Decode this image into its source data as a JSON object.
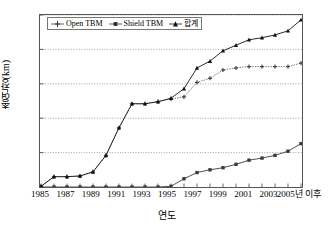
{
  "chart_data": {
    "type": "line",
    "title": "",
    "xlabel": "연도",
    "ylabel": "총연장(km)",
    "ylim": [
      0,
      250
    ],
    "yticks": [
      0,
      50,
      100,
      150,
      200,
      250
    ],
    "grid": true,
    "legend_position": "top-left-inside",
    "x": [
      "1985",
      "1986",
      "1987",
      "1988",
      "1989",
      "1990",
      "1991",
      "1992",
      "1993",
      "1994",
      "1995",
      "1996",
      "1997",
      "1998",
      "1999",
      "2000",
      "2001",
      "2002",
      "2003",
      "2004",
      "2005년 이후"
    ],
    "xtick_labels": [
      "1985",
      "",
      "1987",
      "",
      "1989",
      "",
      "1991",
      "",
      "1993",
      "",
      "1995",
      "",
      "1997",
      "",
      "1999",
      "",
      "2001",
      "",
      "2003",
      "",
      "2005년 이후"
    ],
    "series": [
      {
        "name": "Open TBM",
        "marker": "plus",
        "color": "#3a3a3a",
        "values": [
          1,
          15,
          15,
          16,
          22,
          46,
          86,
          121,
          121,
          124,
          128,
          131,
          152,
          158,
          170,
          173,
          175,
          175,
          175,
          175,
          180
        ]
      },
      {
        "name": "Shield TBM",
        "marker": "square",
        "color": "#3a3a3a",
        "values": [
          0,
          0,
          0,
          0,
          0,
          0,
          0,
          0,
          0,
          0,
          1,
          12,
          21,
          25,
          28,
          33,
          39,
          42,
          46,
          52,
          63
        ]
      },
      {
        "name": "합계",
        "marker": "triangle",
        "color": "#111111",
        "values": [
          1,
          15,
          15,
          16,
          22,
          46,
          86,
          121,
          121,
          124,
          129,
          143,
          173,
          183,
          198,
          206,
          214,
          217,
          221,
          227,
          243
        ]
      }
    ]
  }
}
